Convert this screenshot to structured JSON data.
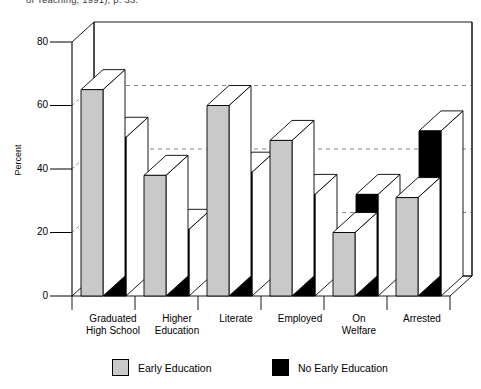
{
  "citation": {
    "text": "of Teaching, 1991), p. 33."
  },
  "axes": {
    "y_title": "Percent",
    "y_ticks": [
      "80",
      "60",
      "40",
      "20",
      "0"
    ],
    "x_labels": [
      "Graduated\nHigh School",
      "Higher\nEducation",
      "Literate",
      "Employed",
      "On\nWelfare",
      "Arrested"
    ]
  },
  "legend": {
    "entries": [
      {
        "label": "Early Education",
        "color": "#c9c9c9"
      },
      {
        "label": "No Early Education",
        "color": "#000000"
      }
    ]
  },
  "colors": {
    "series_early": "#c9c9c9",
    "series_no_early": "#000000",
    "axis": "#000000",
    "grid": "#555555",
    "bar_top": "#ffffff",
    "bar_side": "#ffffff"
  },
  "chart_data": {
    "type": "bar",
    "title": "",
    "subtitle": "",
    "xlabel": "",
    "ylabel": "Percent",
    "ylim": [
      0,
      80
    ],
    "yticks": [
      0,
      20,
      40,
      60,
      80
    ],
    "grid": true,
    "legend_position": "bottom",
    "three_d": true,
    "categories": [
      "Graduated High School",
      "Higher Education",
      "Literate",
      "Employed",
      "On Welfare",
      "Arrested"
    ],
    "series": [
      {
        "name": "Early Education",
        "color": "#c9c9c9",
        "values": [
          65,
          38,
          60,
          49,
          20,
          31
        ]
      },
      {
        "name": "No Early Education",
        "color": "#000000",
        "values": [
          50,
          21,
          39,
          32,
          32,
          52
        ]
      }
    ]
  }
}
